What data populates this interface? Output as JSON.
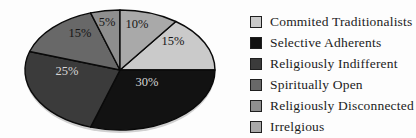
{
  "chart_data": {
    "type": "pie",
    "title": "",
    "legend_position": "right",
    "start_angle_deg": 36,
    "clockwise": true,
    "slice_stroke": "#0a0a0a",
    "shadow_color": "#9a9a9a",
    "geometry": {
      "cx": 120,
      "cy": 70,
      "rx": 95,
      "ry": 60
    },
    "slices": [
      {
        "label": "Commited Traditionalists",
        "value": 15,
        "pct_label": "15%",
        "color": "#cacaca",
        "label_color": "#161616",
        "label_x": 173,
        "label_y": 45
      },
      {
        "label": "Selective Adherents",
        "value": 30,
        "pct_label": "30%",
        "color": "#121212",
        "label_color": "#d6d6d6",
        "label_x": 147,
        "label_y": 86
      },
      {
        "label": "Religiously Indifferent",
        "value": 25,
        "pct_label": "25%",
        "color": "#3b3b3b",
        "label_color": "#d6d6d6",
        "label_x": 67,
        "label_y": 75
      },
      {
        "label": "Spiritually Open",
        "value": 15,
        "pct_label": "15%",
        "color": "#686868",
        "label_color": "#161616",
        "label_x": 80,
        "label_y": 37
      },
      {
        "label": "Religiously Disconnected",
        "value": 5,
        "pct_label": "5%",
        "color": "#8e8e8e",
        "label_color": "#161616",
        "label_x": 107,
        "label_y": 26
      },
      {
        "label": "Irrelgious",
        "value": 10,
        "pct_label": "10%",
        "color": "#a9a9a9",
        "label_color": "#161616",
        "label_x": 137,
        "label_y": 28
      }
    ]
  }
}
